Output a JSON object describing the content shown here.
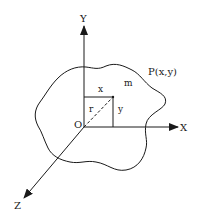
{
  "diagram": {
    "axes": {
      "x_label": "X",
      "y_label": "Y",
      "z_label": "Z",
      "origin_label": "O"
    },
    "point_label": "P(x,y)",
    "mass_label": "m",
    "component_labels": {
      "x": "x",
      "y": "y",
      "r": "r"
    },
    "colors": {
      "stroke": "#1a1a1a",
      "background": "#ffffff"
    }
  }
}
